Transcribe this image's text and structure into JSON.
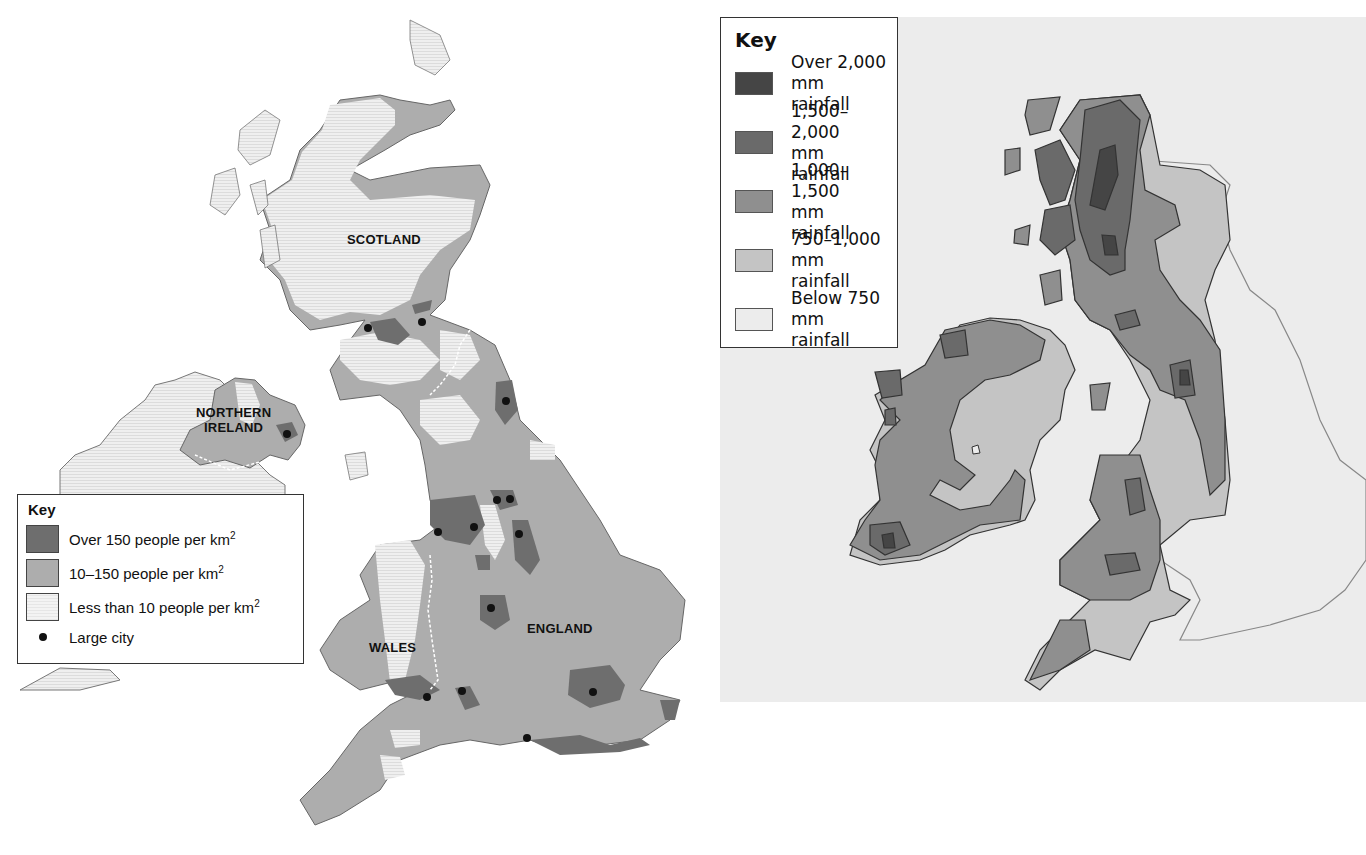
{
  "population_map": {
    "regions": [
      {
        "name": "scotland",
        "label": "SCOTLAND"
      },
      {
        "name": "northern-ireland",
        "label": "NORTHERN\nIRELAND",
        "line1": "NORTHERN",
        "line2": "IRELAND"
      },
      {
        "name": "wales",
        "label": "WALES"
      },
      {
        "name": "england",
        "label": "ENGLAND"
      }
    ],
    "key": {
      "title": "Key",
      "items": [
        {
          "label": "Over 150 people per km",
          "superscript": "2",
          "color": "#6e6e6e"
        },
        {
          "label": "10–150 people per km",
          "superscript": "2",
          "color": "#adadad"
        },
        {
          "label": "Less than 10 people per km",
          "superscript": "2",
          "color": "#eeeeee"
        },
        {
          "label": "Large city",
          "symbol": "dot",
          "color": "#111111"
        }
      ]
    },
    "colors": {
      "dense": "#6e6e6e",
      "medium": "#adadad",
      "sparse": "#ededed",
      "outline": "#555555",
      "city": "#111111"
    }
  },
  "rainfall_map": {
    "key": {
      "title": "Key",
      "items": [
        {
          "line1": "Over 2,000",
          "line2": "mm rainfall",
          "color": "#454545"
        },
        {
          "line1": "1,500–2,000",
          "line2": "mm rainfall",
          "color": "#6a6a6a"
        },
        {
          "line1": "1,000–1,500",
          "line2": "mm rainfall",
          "color": "#8f8f8f"
        },
        {
          "line1": "750–1,000",
          "line2": "mm rainfall",
          "color": "#c4c4c4"
        },
        {
          "line1": "Below 750",
          "line2": "mm rainfall",
          "color": "#ececec"
        }
      ]
    },
    "colors": {
      "background": "#ececec",
      "outline": "#333333"
    }
  }
}
